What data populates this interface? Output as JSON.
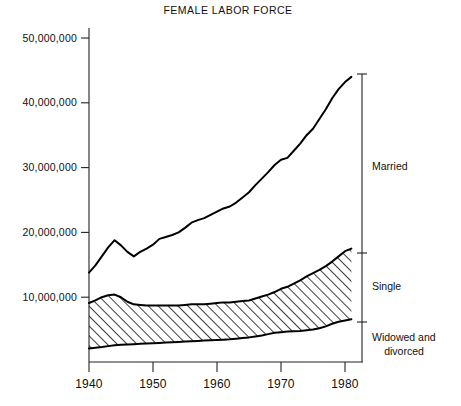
{
  "chart_data": {
    "type": "area",
    "title": "FEMALE LABOR FORCE",
    "xlabel": "",
    "ylabel": "",
    "xlim": [
      1940,
      1981
    ],
    "ylim": [
      0,
      52000000
    ],
    "grid": false,
    "legend_position": "right-brackets",
    "xticks": [
      1940,
      1950,
      1960,
      1970,
      1980
    ],
    "xtick_labels": [
      "1940",
      "1950",
      "1960",
      "1970",
      "1980"
    ],
    "yticks": [
      10000000,
      20000000,
      30000000,
      40000000,
      50000000
    ],
    "ytick_labels": [
      "10,000,000",
      "20,000,000",
      "30,000,000",
      "40,000,000",
      "50,000,000"
    ],
    "annotations": [
      {
        "label": "Married",
        "value_at_1981": 44000000
      },
      {
        "label": "Single",
        "value_at_1981": 17500000
      },
      {
        "label": "Widowed and",
        "value_at_1981": 6500000
      },
      {
        "label": "divorced",
        "value_at_1981": 6500000
      }
    ],
    "x": [
      1940,
      1941,
      1942,
      1943,
      1944,
      1945,
      1946,
      1947,
      1948,
      1949,
      1950,
      1951,
      1952,
      1953,
      1954,
      1955,
      1956,
      1957,
      1958,
      1959,
      1960,
      1961,
      1962,
      1963,
      1964,
      1965,
      1966,
      1967,
      1968,
      1969,
      1970,
      1971,
      1972,
      1973,
      1974,
      1975,
      1976,
      1977,
      1978,
      1979,
      1980,
      1981
    ],
    "series": [
      {
        "name": "Total (all marital statuses)",
        "boundary": "top-of-married",
        "values": [
          13800000,
          14900000,
          16300000,
          17700000,
          18800000,
          18000000,
          17000000,
          16300000,
          17000000,
          17500000,
          18100000,
          19000000,
          19300000,
          19600000,
          20000000,
          20700000,
          21500000,
          21900000,
          22200000,
          22700000,
          23200000,
          23700000,
          24000000,
          24600000,
          25400000,
          26200000,
          27300000,
          28300000,
          29300000,
          30400000,
          31200000,
          31500000,
          32600000,
          33700000,
          35000000,
          36000000,
          37500000,
          39000000,
          40700000,
          42100000,
          43200000,
          44000000
        ]
      },
      {
        "name": "Single + Widowed and divorced",
        "boundary": "top-of-single",
        "values": [
          9100000,
          9500000,
          10000000,
          10300000,
          10400000,
          10000000,
          9300000,
          8900000,
          8800000,
          8700000,
          8700000,
          8700000,
          8700000,
          8700000,
          8700000,
          8800000,
          8900000,
          8900000,
          8900000,
          9000000,
          9100000,
          9200000,
          9200000,
          9300000,
          9400000,
          9500000,
          9800000,
          10100000,
          10400000,
          10800000,
          11300000,
          11600000,
          12100000,
          12600000,
          13200000,
          13700000,
          14200000,
          14800000,
          15500000,
          16300000,
          17100000,
          17500000
        ]
      },
      {
        "name": "Widowed and divorced",
        "boundary": "top-of-widowed",
        "values": [
          2100000,
          2200000,
          2300000,
          2450000,
          2600000,
          2650000,
          2700000,
          2750000,
          2800000,
          2850000,
          2900000,
          2950000,
          3000000,
          3050000,
          3100000,
          3150000,
          3200000,
          3250000,
          3300000,
          3350000,
          3400000,
          3450000,
          3500000,
          3600000,
          3700000,
          3800000,
          3950000,
          4100000,
          4300000,
          4500000,
          4600000,
          4700000,
          4750000,
          4800000,
          4900000,
          5000000,
          5200000,
          5500000,
          5900000,
          6200000,
          6400000,
          6600000
        ]
      }
    ]
  },
  "legend": {
    "married": "Married",
    "single": "Single",
    "widowed_line1": "Widowed and",
    "widowed_line2": "divorced"
  },
  "axes": {
    "title": "FEMALE LABOR FORCE"
  }
}
